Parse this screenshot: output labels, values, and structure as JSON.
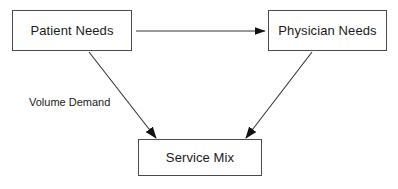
{
  "diagram": {
    "type": "flow-diagram",
    "background_color": "#ffffff",
    "line_color": "#4a4a4a",
    "text_color": "#1a1a1a",
    "nodes": [
      {
        "id": "patient-needs",
        "label": "Patient Needs",
        "shape": "rectangle",
        "x": 12,
        "y": 10,
        "width": 120,
        "height": 41
      },
      {
        "id": "physician-needs",
        "label": "Physician Needs",
        "shape": "rectangle",
        "x": 268,
        "y": 10,
        "width": 119,
        "height": 41
      },
      {
        "id": "service-mix",
        "label": "Service Mix",
        "shape": "rectangle",
        "x": 138,
        "y": 139,
        "width": 124,
        "height": 37
      }
    ],
    "edges": [
      {
        "id": "patient-to-physician",
        "from": "patient-needs",
        "to": "physician-needs",
        "label": "",
        "arrowhead": "filled-triangle",
        "style": "solid"
      },
      {
        "id": "patient-to-service-mix",
        "from": "patient-needs",
        "to": "service-mix",
        "label": "Volume Demand",
        "arrowhead": "filled-triangle",
        "style": "solid"
      },
      {
        "id": "physician-to-service-mix",
        "from": "physician-needs",
        "to": "service-mix",
        "label": "",
        "arrowhead": "filled-triangle",
        "style": "solid"
      }
    ],
    "labels": [
      {
        "id": "volume-demand",
        "text": "Volume Demand",
        "x": 29,
        "y": 97
      }
    ]
  }
}
